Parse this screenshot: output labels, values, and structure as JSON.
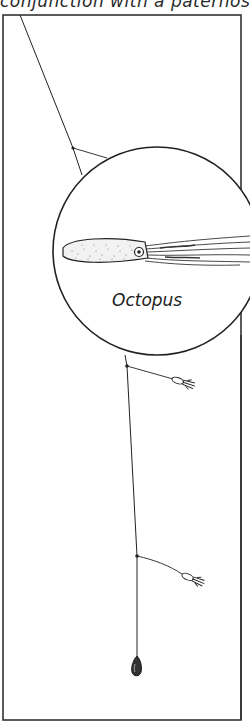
{
  "caption": "conjunction with a paternoster",
  "diagram": {
    "type": "fishing-rig-illustration",
    "inset_label": "Octopus",
    "components": [
      {
        "name": "main-line"
      },
      {
        "name": "inset-circle",
        "depicts": "octopus"
      },
      {
        "name": "dropper-lure-1",
        "depicts": "small squid lure"
      },
      {
        "name": "dropper-lure-2",
        "depicts": "small squid lure"
      },
      {
        "name": "sinker"
      }
    ]
  },
  "colors": {
    "line": "#222222",
    "background": "#ffffff",
    "frame": "#333333"
  }
}
